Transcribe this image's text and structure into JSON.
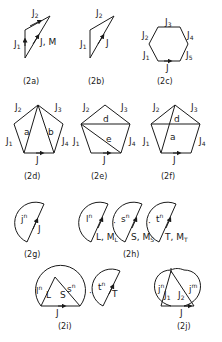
{
  "figures": {
    "a": {
      "caption": "(2a)",
      "j1": "J",
      "j1_sub": "1",
      "j2": "J",
      "j2_sub": "2",
      "j": "J, M"
    },
    "b": {
      "caption": "(2b)",
      "j1": "J",
      "j1_sub": "1",
      "j2": "J",
      "j2_sub": "2",
      "j": "J"
    },
    "c": {
      "caption": "(2c)",
      "labels": [
        {
          "t": "J",
          "s": "1"
        },
        {
          "t": "J",
          "s": "2"
        },
        {
          "t": "J",
          "s": "3"
        },
        {
          "t": "J",
          "s": "4"
        },
        {
          "t": "J",
          "s": "5"
        }
      ],
      "j": "J"
    },
    "d": {
      "caption": "(2d)",
      "labels": [
        {
          "t": "J",
          "s": "1"
        },
        {
          "t": "J",
          "s": "2"
        },
        {
          "t": "J",
          "s": "3"
        },
        {
          "t": "J",
          "s": "4"
        }
      ],
      "j": "J",
      "inner": [
        "a",
        "b"
      ]
    },
    "e": {
      "caption": "(2e)",
      "labels": [
        {
          "t": "J",
          "s": "1"
        },
        {
          "t": "J",
          "s": "2"
        },
        {
          "t": "J",
          "s": "3"
        },
        {
          "t": "J",
          "s": "4"
        }
      ],
      "j": "J",
      "inner": [
        "d",
        "e"
      ]
    },
    "f": {
      "caption": "(2f)",
      "labels": [
        {
          "t": "J",
          "s": "1"
        },
        {
          "t": "J",
          "s": "2"
        },
        {
          "t": "J",
          "s": "3"
        },
        {
          "t": "J",
          "s": "4"
        }
      ],
      "j": "J",
      "inner": [
        "d",
        "a"
      ]
    },
    "g": {
      "caption": "(2g)",
      "inner": "j",
      "sup": "n",
      "j": "J"
    },
    "h": {
      "caption": "(2h)",
      "parts": [
        {
          "inner": "l",
          "sup": "n",
          "label": "L, M",
          "sub": "L"
        },
        {
          "inner": "s",
          "sup": "n",
          "label": "S, M",
          "sub": "S"
        },
        {
          "inner": "t",
          "sup": "n",
          "label": "T, M",
          "sub": "T"
        }
      ],
      "dot": "·"
    },
    "i": {
      "caption": "(2i)",
      "l": "l",
      "l_sup": "n",
      "L": "L",
      "s": "s",
      "s_sup": "n",
      "S": "S",
      "t": "t",
      "t_sup": "n",
      "T": "T",
      "j": "J",
      "dot": "·"
    },
    "j": {
      "caption": "(2j)",
      "j1": "j",
      "j1_sup": "n",
      "J1": "J",
      "J1_sub": "1",
      "j2": "j",
      "j2_sup": "m",
      "J2": "J",
      "J2_sub": "2",
      "j": "J"
    }
  }
}
